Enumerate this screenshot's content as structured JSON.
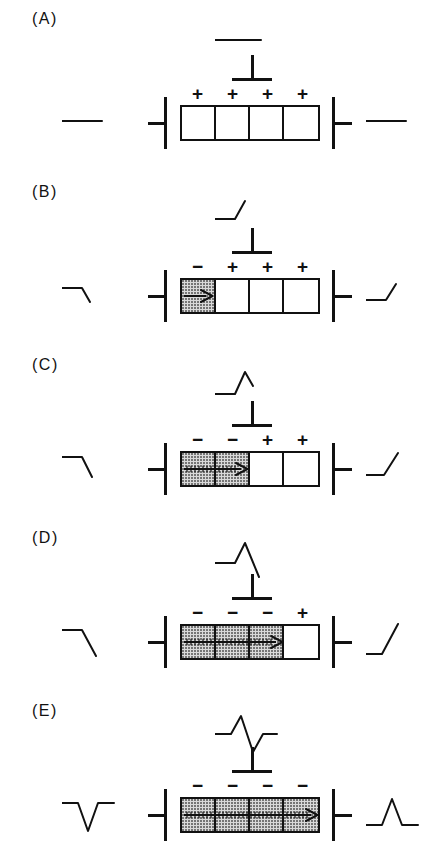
{
  "figure": {
    "cell_count": 4,
    "panel_count": 5,
    "colors": {
      "ink": "#111111",
      "background": "#ffffff",
      "depolarized_fill": "#d9d9d9",
      "stipple_dot": "#6e6e6e"
    },
    "electrode_symbols": {
      "left": "left-facing-electrode",
      "right": "right-facing-electrode",
      "center": "overhead-recording-electrode"
    },
    "sign_positive": "+",
    "sign_negative": "−"
  },
  "panels": [
    {
      "id": "A",
      "label": "(A)",
      "cells": [
        {
          "state": "resting",
          "sign": "+"
        },
        {
          "state": "resting",
          "sign": "+"
        },
        {
          "state": "resting",
          "sign": "+"
        },
        {
          "state": "resting",
          "sign": "+"
        }
      ],
      "arrow": {
        "visible": false,
        "span_cells": 0
      },
      "waveforms": {
        "center": {
          "name": "flat-baseline",
          "shape": "flat",
          "points": "0,20 46,20"
        },
        "left": {
          "name": "flat-baseline",
          "shape": "flat",
          "points": "0,20 40,20"
        },
        "right": {
          "name": "flat-baseline",
          "shape": "flat",
          "points": "0,20 40,20"
        }
      }
    },
    {
      "id": "B",
      "label": "(B)",
      "cells": [
        {
          "state": "depolarized",
          "sign": "−"
        },
        {
          "state": "resting",
          "sign": "+"
        },
        {
          "state": "resting",
          "sign": "+"
        },
        {
          "state": "resting",
          "sign": "+"
        }
      ],
      "arrow": {
        "visible": true,
        "span_cells": 1
      },
      "waveforms": {
        "center": {
          "name": "rising-upstroke",
          "shape": "upstroke-start",
          "points": "0,26 20,26 30,8"
        },
        "left": {
          "name": "falling-downstroke",
          "shape": "downstroke-start",
          "points": "0,14 20,14 28,28"
        },
        "right": {
          "name": "rising-upstroke",
          "shape": "upstroke-start",
          "points": "0,26 20,26 30,10"
        }
      }
    },
    {
      "id": "C",
      "label": "(C)",
      "cells": [
        {
          "state": "depolarized",
          "sign": "−"
        },
        {
          "state": "depolarized",
          "sign": "−"
        },
        {
          "state": "resting",
          "sign": "+"
        },
        {
          "state": "resting",
          "sign": "+"
        }
      ],
      "arrow": {
        "visible": true,
        "span_cells": 2
      },
      "waveforms": {
        "center": {
          "name": "positive-peak-partial",
          "shape": "peak-descending",
          "points": "0,28 20,28 30,6 38,20"
        },
        "left": {
          "name": "negative-deflection-partial",
          "shape": "trough-start",
          "points": "0,10 20,10 30,30"
        },
        "right": {
          "name": "rising-upstroke",
          "shape": "upstroke-rising",
          "points": "0,28 18,28 32,6"
        }
      }
    },
    {
      "id": "D",
      "label": "(D)",
      "cells": [
        {
          "state": "depolarized",
          "sign": "−"
        },
        {
          "state": "depolarized",
          "sign": "−"
        },
        {
          "state": "depolarized",
          "sign": "−"
        },
        {
          "state": "resting",
          "sign": "+"
        }
      ],
      "arrow": {
        "visible": true,
        "span_cells": 3
      },
      "waveforms": {
        "center": {
          "name": "peak-then-downslope",
          "shape": "peak-deep-descent",
          "points": "0,24 20,24 30,4 44,38"
        },
        "left": {
          "name": "descending-trough",
          "shape": "downstroke-deep",
          "points": "0,10 20,10 34,36"
        },
        "right": {
          "name": "steep-upstroke",
          "shape": "upstroke-steep",
          "points": "0,34 16,34 32,4"
        }
      }
    },
    {
      "id": "E",
      "label": "(E)",
      "cells": [
        {
          "state": "depolarized",
          "sign": "−"
        },
        {
          "state": "depolarized",
          "sign": "−"
        },
        {
          "state": "depolarized",
          "sign": "−"
        },
        {
          "state": "depolarized",
          "sign": "−"
        }
      ],
      "arrow": {
        "visible": true,
        "span_cells": 4
      },
      "waveforms": {
        "center": {
          "name": "biphasic-complex",
          "shape": "biphasic-up-down",
          "points": "0,22 16,22 26,4 38,40 48,22 62,22"
        },
        "left": {
          "name": "negative-monophasic",
          "shape": "trough-complete",
          "points": "0,10 16,10 26,38 36,10 52,10"
        },
        "right": {
          "name": "positive-monophasic",
          "shape": "peak-complete",
          "points": "0,32 16,32 26,6 36,32 52,32"
        }
      }
    }
  ]
}
